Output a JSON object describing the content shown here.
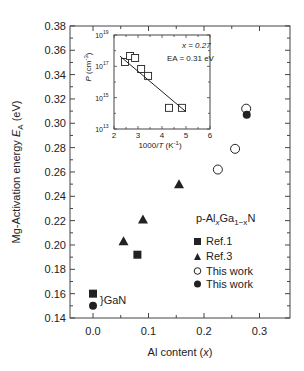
{
  "chart_data": [
    {
      "type": "scatter",
      "title": "",
      "xlabel": "Al content (x)",
      "ylabel": "Mg-Activation energy E_A (eV)",
      "xlim": [
        -0.04,
        0.35
      ],
      "ylim": [
        0.14,
        0.38
      ],
      "xticks": [
        "0.0",
        "0.1",
        "0.2",
        "0.3"
      ],
      "yticks": [
        "0.14",
        "0.16",
        "0.18",
        "0.20",
        "0.22",
        "0.24",
        "0.26",
        "0.28",
        "0.30",
        "0.32",
        "0.34",
        "0.36",
        "0.38"
      ],
      "grid": false,
      "legend_title": "p-AlxGa1-xN",
      "legend_position": "center-right",
      "annotation": "}GaN",
      "series": [
        {
          "name": "Ref.1",
          "marker": "filled-square",
          "points": [
            [
              0.0,
              0.16
            ],
            [
              0.08,
              0.192
            ]
          ]
        },
        {
          "name": "Ref.3",
          "marker": "filled-triangle",
          "points": [
            [
              0.055,
              0.203
            ],
            [
              0.09,
              0.221
            ],
            [
              0.155,
              0.25
            ]
          ]
        },
        {
          "name": "This work",
          "marker": "open-circle",
          "points": [
            [
              0.225,
              0.262
            ],
            [
              0.256,
              0.279
            ],
            [
              0.276,
              0.312
            ]
          ]
        },
        {
          "name": "This work",
          "marker": "filled-circle",
          "points": [
            [
              0.0,
              0.15
            ],
            [
              0.277,
              0.307
            ]
          ]
        }
      ]
    },
    {
      "type": "scatter",
      "title": "inset",
      "xlabel": "1000/T (K-1)",
      "ylabel": "P (cm-3)",
      "xlim": [
        2,
        6
      ],
      "ylim_log10": [
        13,
        19
      ],
      "xticks": [
        "2",
        "3",
        "4",
        "5",
        "6"
      ],
      "yticks": [
        "10^13",
        "10^15",
        "10^17",
        "10^19"
      ],
      "annotations": [
        "x = 0.27",
        "EA = 0.31 eV"
      ],
      "series": [
        {
          "name": "data",
          "marker": "open-square",
          "points_log10": [
            [
              2.46,
              17.28
            ],
            [
              2.67,
              17.66
            ],
            [
              2.88,
              17.53
            ],
            [
              3.13,
              16.83
            ],
            [
              3.42,
              16.39
            ],
            [
              4.29,
              14.35
            ],
            [
              4.83,
              14.35
            ]
          ]
        },
        {
          "name": "fit",
          "type": "line",
          "points_log10": [
            [
              2.25,
              17.65
            ],
            [
              5.0,
              14.1
            ]
          ]
        }
      ]
    }
  ],
  "labels": {
    "xlabel_pre": "Al content (",
    "xlabel_var": "x",
    "xlabel_post": ")",
    "ylabel_pre": "Mg-Activation energy ",
    "ylabel_var": "E",
    "ylabel_sub": "A",
    "ylabel_post": " (eV)",
    "legend_title_p": "p-Al",
    "legend_title_x": "x",
    "legend_title_ga": "Ga",
    "legend_title_sub": "1−x",
    "legend_title_n": "N",
    "legend_ref1": "Ref.1",
    "legend_ref3": "Ref.3",
    "legend_open": "This work",
    "legend_filled": "This work",
    "gan": "}GaN",
    "inset_x_pre": "1000/",
    "inset_x_var": "T",
    "inset_x_post": " (K",
    "inset_x_sup": "-1",
    "inset_x_end": ")",
    "inset_y_var": "P",
    "inset_y_pre": " (cm",
    "inset_y_sup": "-3",
    "inset_y_end": ")",
    "inset_ann1": "x = 0.27",
    "inset_ann2": "EA = 0.31 eV"
  },
  "colors": {
    "ink": "#222222",
    "axis": "#444444",
    "background": "#ffffff"
  }
}
